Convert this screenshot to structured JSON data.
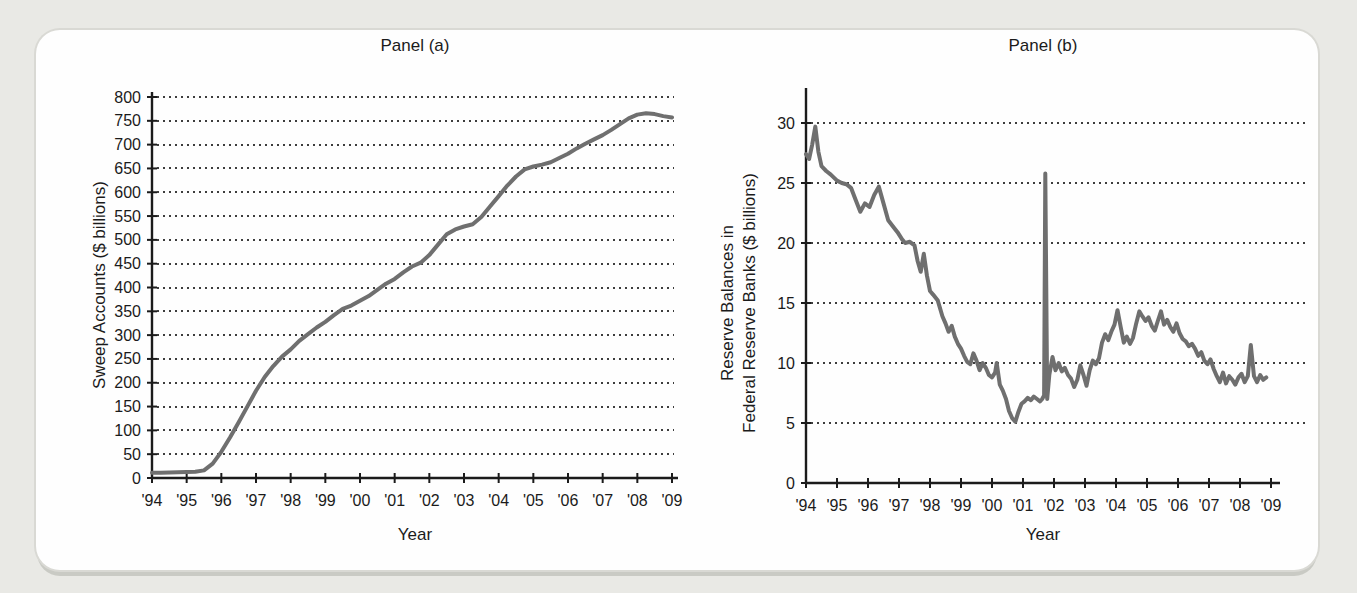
{
  "page": {
    "background_color": "#e9e9e5",
    "card_background_color": "#fefefe",
    "line_color": "#6f6f6f",
    "grid_dot_color": "#3d3d3d",
    "axis_color": "#1b1b1b"
  },
  "chart_data": [
    {
      "type": "line",
      "panel": "a",
      "title": "Panel (a)",
      "xlabel": "Year",
      "ylabel": "Sweep Accounts ($ billions)",
      "ylabel_lines": [
        "Sweep Accounts ($ billions)"
      ],
      "ylim": [
        0,
        800
      ],
      "xlim": [
        1994,
        2009
      ],
      "grid": "dotted-horizontal",
      "legend": "none",
      "line_color": "#6f6f6f",
      "y_ticks": [
        0,
        50,
        100,
        150,
        200,
        250,
        300,
        350,
        400,
        450,
        500,
        550,
        600,
        650,
        700,
        750,
        800
      ],
      "x_tick_values": [
        1994,
        1995,
        1996,
        1997,
        1998,
        1999,
        2000,
        2001,
        2002,
        2003,
        2004,
        2005,
        2006,
        2007,
        2008,
        2009
      ],
      "x_tick_labels": [
        "'94",
        "'95",
        "'96",
        "'97",
        "'98",
        "'99",
        "'00",
        "'01",
        "'02",
        "'03",
        "'04",
        "'05",
        "'06",
        "'07",
        "'08",
        "'09"
      ],
      "series": [
        {
          "name": "Sweep accounts",
          "x": [
            1994,
            1994.25,
            1994.5,
            1994.75,
            1995,
            1995.25,
            1995.5,
            1995.75,
            1996,
            1996.25,
            1996.5,
            1996.75,
            1997,
            1997.25,
            1997.5,
            1997.75,
            1998,
            1998.25,
            1998.5,
            1998.75,
            1999,
            1999.25,
            1999.5,
            1999.75,
            2000,
            2000.25,
            2000.5,
            2000.75,
            2001,
            2001.25,
            2001.5,
            2001.75,
            2002,
            2002.25,
            2002.5,
            2002.75,
            2003,
            2003.25,
            2003.5,
            2003.75,
            2004,
            2004.25,
            2004.5,
            2004.75,
            2005,
            2005.25,
            2005.5,
            2005.75,
            2006,
            2006.25,
            2006.5,
            2006.75,
            2007,
            2007.25,
            2007.5,
            2007.75,
            2008,
            2008.25,
            2008.5,
            2008.75,
            2009
          ],
          "y": [
            11,
            11,
            11.5,
            12,
            12.5,
            13,
            16,
            30,
            55,
            85,
            117,
            150,
            183,
            212,
            235,
            255,
            270,
            288,
            302,
            316,
            328,
            342,
            355,
            362,
            372,
            382,
            395,
            408,
            418,
            432,
            444,
            452,
            468,
            490,
            512,
            522,
            528,
            533,
            548,
            570,
            592,
            614,
            633,
            648,
            654,
            658,
            663,
            672,
            681,
            692,
            702,
            711,
            720,
            731,
            743,
            755,
            763,
            766,
            764,
            760,
            757
          ]
        }
      ]
    },
    {
      "type": "line",
      "panel": "b",
      "title": "Panel (b)",
      "xlabel": "Year",
      "ylabel": "Reserve Balances in Federal Reserve Banks ($ billions)",
      "ylabel_lines": [
        "Reserve Balances in",
        "Federal Reserve Banks ($ billions)"
      ],
      "ylim": [
        0,
        32.5
      ],
      "xlim": [
        1994,
        2009
      ],
      "grid": "dotted-horizontal",
      "legend": "none",
      "line_color": "#6f6f6f",
      "y_ticks": [
        0,
        5,
        10,
        15,
        20,
        25,
        30
      ],
      "x_tick_values": [
        1994,
        1995,
        1996,
        1997,
        1998,
        1999,
        2000,
        2001,
        2002,
        2003,
        2004,
        2005,
        2006,
        2007,
        2008,
        2009
      ],
      "x_tick_labels": [
        "'94",
        "'95",
        "'96",
        "'97",
        "'98",
        "'99",
        "'00",
        "'01",
        "'02",
        "'03",
        "'04",
        "'05",
        "'06",
        "'07",
        "'08",
        "'09"
      ],
      "series": [
        {
          "name": "Reserve balances",
          "x": [
            1994.0,
            1994.1,
            1994.2,
            1994.3,
            1994.4,
            1994.5,
            1994.65,
            1994.8,
            1995.0,
            1995.15,
            1995.3,
            1995.45,
            1995.6,
            1995.75,
            1995.9,
            1996.05,
            1996.2,
            1996.35,
            1996.5,
            1996.65,
            1996.8,
            1996.95,
            1997.1,
            1997.2,
            1997.35,
            1997.5,
            1997.6,
            1997.7,
            1997.8,
            1997.9,
            1998.0,
            1998.1,
            1998.25,
            1998.4,
            1998.5,
            1998.6,
            1998.7,
            1998.8,
            1998.9,
            1999.0,
            1999.1,
            1999.2,
            1999.3,
            1999.4,
            1999.5,
            1999.6,
            1999.7,
            1999.8,
            1999.9,
            2000.0,
            2000.1,
            2000.15,
            2000.25,
            2000.35,
            2000.45,
            2000.55,
            2000.65,
            2000.75,
            2000.85,
            2000.95,
            2001.05,
            2001.15,
            2001.25,
            2001.35,
            2001.45,
            2001.55,
            2001.62,
            2001.68,
            2001.72,
            2001.78,
            2001.85,
            2001.95,
            2002.05,
            2002.15,
            2002.25,
            2002.35,
            2002.45,
            2002.55,
            2002.65,
            2002.75,
            2002.85,
            2002.95,
            2003.05,
            2003.15,
            2003.25,
            2003.35,
            2003.45,
            2003.55,
            2003.65,
            2003.75,
            2003.85,
            2003.95,
            2004.05,
            2004.15,
            2004.25,
            2004.35,
            2004.45,
            2004.55,
            2004.65,
            2004.75,
            2004.85,
            2004.95,
            2005.05,
            2005.15,
            2005.25,
            2005.35,
            2005.45,
            2005.55,
            2005.65,
            2005.75,
            2005.85,
            2005.95,
            2006.05,
            2006.15,
            2006.25,
            2006.35,
            2006.45,
            2006.55,
            2006.65,
            2006.75,
            2006.85,
            2006.95,
            2007.05,
            2007.15,
            2007.25,
            2007.35,
            2007.45,
            2007.55,
            2007.65,
            2007.75,
            2007.85,
            2007.95,
            2008.05,
            2008.15,
            2008.25,
            2008.35,
            2008.45,
            2008.55,
            2008.65,
            2008.75,
            2008.85
          ],
          "y": [
            27.4,
            27.0,
            28.2,
            29.7,
            27.6,
            26.4,
            26.0,
            25.7,
            25.2,
            25.0,
            24.9,
            24.6,
            23.6,
            22.6,
            23.3,
            23.0,
            24.0,
            24.7,
            23.3,
            21.9,
            21.4,
            20.9,
            20.3,
            20.0,
            20.1,
            19.8,
            18.5,
            17.6,
            19.1,
            17.3,
            16.0,
            15.7,
            15.2,
            13.9,
            13.3,
            12.6,
            13.1,
            12.2,
            11.6,
            11.2,
            10.6,
            10.1,
            9.9,
            10.8,
            10.2,
            9.4,
            10.0,
            9.6,
            9.0,
            8.8,
            9.2,
            10.0,
            8.2,
            7.7,
            7.0,
            6.0,
            5.4,
            5.1,
            5.9,
            6.6,
            6.8,
            7.1,
            6.9,
            7.2,
            7.0,
            6.8,
            7.0,
            7.3,
            25.8,
            7.0,
            9.0,
            10.5,
            9.4,
            10.0,
            9.3,
            9.6,
            9.0,
            8.7,
            8.0,
            8.6,
            9.8,
            9.0,
            8.1,
            9.4,
            10.2,
            9.9,
            10.4,
            11.7,
            12.4,
            11.9,
            12.6,
            13.2,
            14.4,
            13.0,
            11.7,
            12.2,
            11.6,
            12.1,
            13.3,
            14.3,
            13.9,
            13.5,
            13.8,
            13.1,
            12.7,
            13.5,
            14.3,
            13.2,
            13.6,
            13.0,
            12.6,
            13.3,
            12.5,
            12.0,
            11.8,
            11.4,
            11.6,
            11.2,
            10.6,
            10.9,
            10.2,
            9.9,
            10.3,
            9.5,
            8.9,
            8.4,
            9.2,
            8.3,
            8.9,
            8.6,
            8.2,
            8.8,
            9.1,
            8.4,
            8.9,
            11.5,
            8.9,
            8.4,
            9.0,
            8.6,
            8.8
          ]
        }
      ]
    }
  ]
}
